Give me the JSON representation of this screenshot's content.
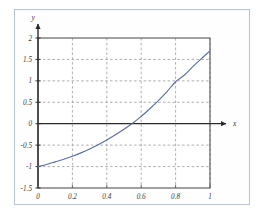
{
  "figure": {
    "background_color": "#ffffff",
    "frame_color": "#b9c4d2",
    "plot_border_color": "#555555",
    "grid_color": "#9a9a9a",
    "axis_color": "#2a2a2a",
    "curve_color": "#5a6f9e"
  },
  "chart_data": {
    "type": "line",
    "title": "",
    "subtitle": "",
    "xlabel": "x",
    "ylabel": "y",
    "xlim": [
      0,
      1
    ],
    "ylim": [
      -1.5,
      2
    ],
    "grid": true,
    "grid_style": "dashed",
    "legend": null,
    "legend_position": "none",
    "xticks": [
      0,
      0.2,
      0.4,
      0.6,
      0.8,
      1
    ],
    "xtick_labels": [
      "0",
      "0.2",
      "0.4",
      "0.6",
      "0.8",
      "1"
    ],
    "yticks": [
      -1.5,
      -1,
      -0.5,
      0,
      0.5,
      1,
      1.5,
      2
    ],
    "ytick_labels": [
      "-1.5",
      "-1",
      "-0.5",
      "0",
      "0.5",
      "1",
      "1.5",
      "2"
    ],
    "zero_line_y": 0,
    "x_axis_arrow": true,
    "y_axis_arrow": true,
    "series": [
      {
        "name": "curve",
        "color": "#5a6f9e",
        "x": [
          0.0,
          0.05,
          0.1,
          0.15,
          0.2,
          0.25,
          0.3,
          0.35,
          0.4,
          0.45,
          0.5,
          0.55,
          0.6,
          0.65,
          0.7,
          0.75,
          0.8,
          0.85,
          0.9,
          0.95,
          1.0
        ],
        "values": [
          -1.0,
          -0.95,
          -0.89,
          -0.83,
          -0.76,
          -0.68,
          -0.59,
          -0.49,
          -0.38,
          -0.26,
          -0.13,
          0.01,
          0.17,
          0.35,
          0.54,
          0.75,
          0.98,
          1.13,
          1.33,
          1.52,
          1.7
        ]
      }
    ],
    "annotations": {
      "zero_crossing_x": 0.545,
      "start_point": [
        0,
        -1
      ],
      "end_point": [
        1,
        1.7
      ]
    }
  }
}
